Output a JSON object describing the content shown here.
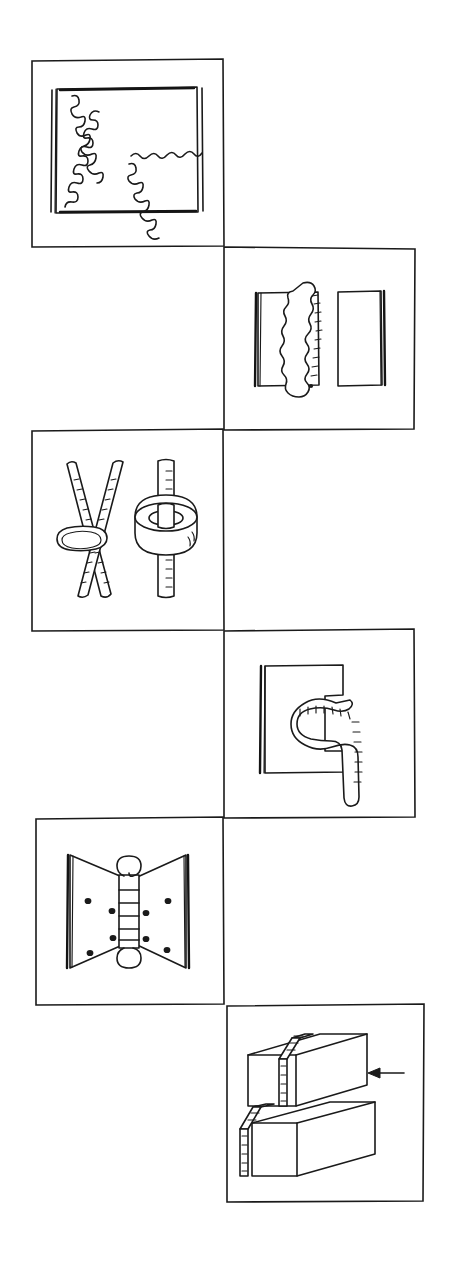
{
  "sheet": {
    "title": "Welded joint technique illustration sheet",
    "style": "hand-drawn line art",
    "background_color": "#ffffff",
    "ink_color": "#1a1a1a",
    "width": 456,
    "height": 1265,
    "panel_count": 6,
    "layout": "staggered two-column zigzag, alternating left and right"
  },
  "panels": [
    {
      "index": 1,
      "position": "left",
      "caption": "",
      "subject": "butt-joint plate with wavy weld seams forming a branching diagonal pattern",
      "frame": {
        "x": 31,
        "y": 60,
        "w": 193,
        "h": 187
      },
      "inner_plate": {
        "x": 55,
        "y": 88,
        "w": 143,
        "h": 125
      },
      "elements": [
        "outer panel border",
        "inner rectangular plate with doubled left and right edges",
        "wavy weld bead running top-left to bottom-right",
        "wavy weld bead running bottom-left to centre",
        "wavy weld bead running centre to right edge"
      ]
    },
    {
      "index": 2,
      "position": "right",
      "caption": "",
      "subject": "two plates butted edge to edge with a heavy vertical weld bead between them",
      "frame": {
        "x": 224,
        "y": 247,
        "w": 191,
        "h": 183
      },
      "elements": [
        "left plate with thick edge bar",
        "right plate with thick edge bar",
        "irregular lumpy vertical weld bead spanning the joint",
        "ripple ticks along the right side of the bead"
      ]
    },
    {
      "index": 3,
      "position": "left",
      "caption": "",
      "subject": "crossed round bars welded at the intersection, and a bar passing through a welded collar ring",
      "frame": {
        "x": 31,
        "y": 430,
        "w": 193,
        "h": 201
      },
      "elements": [
        "two crossed bars with hatched weld texture",
        "weld ring wrapped around the crossing point",
        "vertical bar with hatched weld texture",
        "thick cylindrical collar ring around the vertical bar"
      ]
    },
    {
      "index": 4,
      "position": "right",
      "caption": "",
      "subject": "plate with a rectangular notch and a curved hook-shaped weld deposit filling the slot",
      "frame": {
        "x": 224,
        "y": 631,
        "w": 191,
        "h": 187
      },
      "elements": [
        "square plate with thick left edge bar",
        "rectangular notch cut into the right side",
        "curved hook-shaped weld bead seated in the notch",
        "ripple ticks along the outside of the weld bead"
      ]
    },
    {
      "index": 5,
      "position": "left",
      "caption": "",
      "subject": "butterfly hinge with central barrel knuckle and screw holes in both leaves",
      "frame": {
        "x": 35,
        "y": 818,
        "w": 189,
        "h": 187
      },
      "elements": [
        "left hinge leaf, tapered",
        "right hinge leaf, tapered",
        "thick vertical edge bars on both leaves",
        "central segmented barrel knuckle",
        "pin loops at top and bottom of the barrel",
        "six screw holes"
      ]
    },
    {
      "index": 6,
      "position": "right",
      "caption": "",
      "subject": "two stacked rectangular blocks joined by a stepped weld seam, with an arrow indicating the weld direction",
      "frame": {
        "x": 227,
        "y": 1005,
        "w": 197,
        "h": 197
      },
      "elements": [
        "upper rectangular block in isometric view",
        "lower rectangular block in isometric view",
        "ladder-rung weld seam crossing both blocks",
        "arrow pointing left toward the joint"
      ]
    }
  ]
}
